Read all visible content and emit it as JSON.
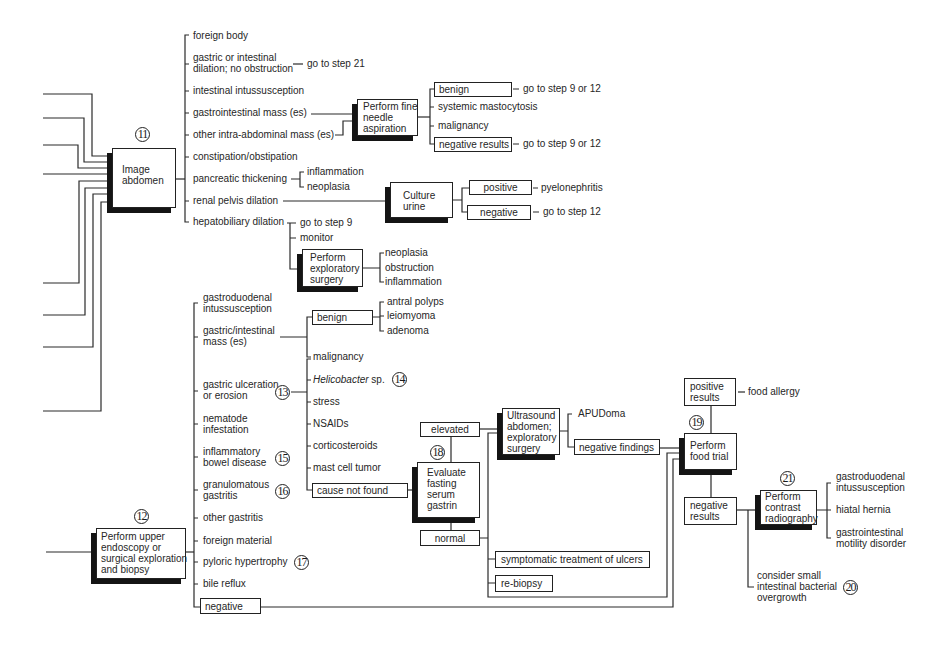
{
  "image_abdomen": {
    "step": "11",
    "box_label": [
      "Image",
      "abdomen"
    ],
    "findings": [
      {
        "text": [
          "foreign body"
        ]
      },
      {
        "text": [
          "gastric or intestinal",
          "dilation; no obstruction"
        ],
        "next": "go to step 21"
      },
      {
        "text": [
          "intestinal intussusception"
        ]
      },
      {
        "text": [
          "gastrointestinal mass (es)"
        ]
      },
      {
        "text": [
          "other intra-abdominal mass (es)"
        ]
      },
      {
        "text": [
          "constipation/obstipation"
        ]
      },
      {
        "text": [
          "pancreatic thickening"
        ],
        "sub": [
          "inflammation",
          "neoplasia"
        ]
      },
      {
        "text": [
          "renal pelvis dilation"
        ]
      },
      {
        "text": [
          "hepatobiliary dilation"
        ]
      }
    ]
  },
  "fine_needle_aspiration": {
    "box_label": [
      "Perform fine",
      "needle",
      "aspiration"
    ],
    "results": [
      {
        "text": "benign",
        "next": "go to step 9 or 12"
      },
      {
        "text": "systemic mastocytosis"
      },
      {
        "text": "malignancy"
      },
      {
        "text": "negative results",
        "next": "go to step 9 or 12"
      }
    ]
  },
  "culture_urine": {
    "box_label": [
      "Culture",
      "urine"
    ],
    "results": [
      {
        "text": "positive",
        "next": "pyelonephritis"
      },
      {
        "text": "negative",
        "next": "go to step 12"
      }
    ]
  },
  "hepatobiliary": {
    "options": [
      "go to step 9",
      "monitor"
    ],
    "exploratory_surgery": {
      "box_label": [
        "Perform",
        "exploratory",
        "surgery"
      ],
      "results": [
        "neoplasia",
        "obstruction",
        "inflammation"
      ]
    }
  },
  "endoscopy": {
    "step": "12",
    "box_label": [
      "Perform upper",
      "endoscopy or",
      "surgical exploration",
      "and biopsy"
    ],
    "findings": [
      {
        "text": [
          "gastroduodenal",
          "intussusception"
        ]
      },
      {
        "text": [
          "gastric/intestinal",
          "mass (es)"
        ]
      },
      {
        "text": [
          "gastric ulceration",
          "or erosion"
        ],
        "step": "13"
      },
      {
        "text": [
          "nematode",
          "infestation"
        ]
      },
      {
        "text": [
          "inflammatory",
          "bowel disease"
        ],
        "step": "15"
      },
      {
        "text": [
          "granulomatous",
          "gastritis"
        ],
        "step": "16"
      },
      {
        "text": [
          "other gastritis"
        ]
      },
      {
        "text": [
          "foreign material"
        ]
      },
      {
        "text": [
          "pyloric hypertrophy"
        ],
        "step": "17"
      },
      {
        "text": [
          "bile reflux"
        ]
      },
      {
        "text": [
          "negative"
        ]
      }
    ]
  },
  "mass": {
    "benign": "benign",
    "benign_types": [
      "antral polyps",
      "leiomyoma",
      "adenoma"
    ],
    "malignancy": "malignancy"
  },
  "ulcer_causes": [
    {
      "text": "Helicobacter",
      "suffix": " sp.",
      "step": "14"
    },
    {
      "text": "stress"
    },
    {
      "text": "NSAIDs"
    },
    {
      "text": "corticosteroids"
    },
    {
      "text": "mast cell tumor"
    },
    {
      "text": "cause not found"
    }
  ],
  "gastrin": {
    "step": "18",
    "box_label": [
      "Evaluate",
      "fasting",
      "serum",
      "gastrin"
    ],
    "elevated": "elevated",
    "normal": "normal"
  },
  "ultrasound": {
    "box_label": [
      "Ultrasound",
      "abdomen;",
      "exploratory",
      "surgery"
    ],
    "results": [
      "APUDoma",
      "negative findings"
    ]
  },
  "normal_options": [
    "symptomatic treatment of ulcers",
    "re-biopsy"
  ],
  "food_trial": {
    "step": "19",
    "box_label": [
      "Perform",
      "food trial"
    ],
    "positive": [
      "positive",
      "results"
    ],
    "positive_result": "food allergy",
    "negative": [
      "negative",
      "results"
    ]
  },
  "sibo": {
    "step": "20",
    "text": [
      "consider small",
      "intestinal bacterial",
      "overgrowth"
    ]
  },
  "contrast": {
    "step": "21",
    "box_label": [
      "Perform",
      "contrast",
      "radiography"
    ],
    "results": [
      [
        "gastroduodenal",
        "intussusception"
      ],
      [
        "hiatal hernia"
      ],
      [
        "gastrointestinal",
        "motility disorder"
      ]
    ]
  }
}
